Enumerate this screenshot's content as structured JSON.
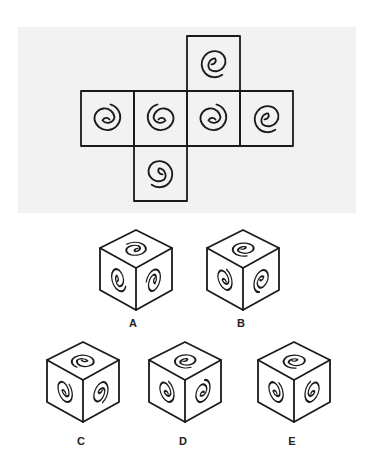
{
  "puzzle": {
    "net": {
      "faces": [
        {
          "id": "top",
          "col": 3,
          "row": 0,
          "spiral": "tail-bottom-right"
        },
        {
          "id": "row-1",
          "col": 1,
          "row": 1,
          "spiral": "tail-top-right"
        },
        {
          "id": "row-2",
          "col": 2,
          "row": 1,
          "spiral": "tail-top-right-mirrored"
        },
        {
          "id": "row-3",
          "col": 3,
          "row": 1,
          "spiral": "tail-top-right"
        },
        {
          "id": "row-4",
          "col": 4,
          "row": 1,
          "spiral": "tail-bottom-right"
        },
        {
          "id": "bottom",
          "col": 2,
          "row": 2,
          "spiral": "tail-bottom-left"
        }
      ]
    },
    "options": [
      {
        "label": "A"
      },
      {
        "label": "B"
      },
      {
        "label": "C"
      },
      {
        "label": "D"
      },
      {
        "label": "E"
      }
    ],
    "colors": {
      "line": "#1a1a1a",
      "panel": "#f2f2f2",
      "background": "#ffffff"
    }
  }
}
